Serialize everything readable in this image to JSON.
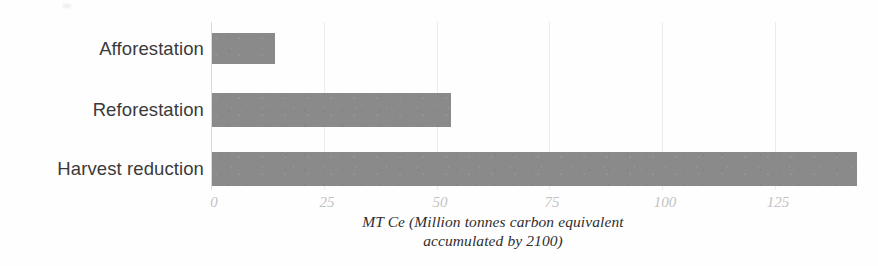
{
  "chart_data": {
    "type": "bar",
    "orientation": "horizontal",
    "title": "",
    "subtitle": "",
    "categories": [
      "Afforestation",
      "Reforestation",
      "Harvest reduction"
    ],
    "values": [
      14,
      53,
      143
    ],
    "series": [
      {
        "name": "MT Ce accumulated by 2100",
        "values": [
          14,
          53,
          143
        ]
      }
    ],
    "xlabel_line1": "MT Ce (Million tonnes carbon equivalent",
    "xlabel_line2": "accumulated by 2100)",
    "xlabel": "MT Ce (Million tonnes carbon equivalent accumulated by 2100)",
    "ylabel": "",
    "xlim": [
      0,
      143
    ],
    "xticks": [
      0,
      25,
      50,
      75,
      100,
      125
    ],
    "xtick_labels": [
      "0",
      "25",
      "50",
      "75",
      "100",
      "125"
    ],
    "grid": true,
    "grid_axis": "x",
    "legend": false,
    "legend_position": "none",
    "bar_color": "#8a8a8a",
    "gridline_color": "#ececec",
    "axis_color": "#d9d9d9",
    "tick_label_color": "#c2c2c2",
    "category_label_color": "#3a3a3a",
    "background_color": "#fffefe",
    "annotations": []
  }
}
